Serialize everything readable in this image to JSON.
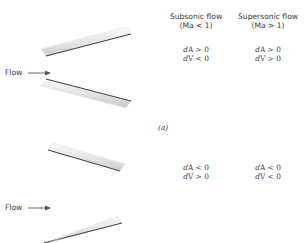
{
  "figure": {
    "type": "technical-diagram",
    "panels": [
      {
        "id": "a",
        "panel_label": "(a)",
        "geometry": "diverging-duct",
        "flow_label": "Flow",
        "flow_arrow": "right-arrow",
        "columns": [
          {
            "heading_line1": "Subsonic flow",
            "heading_line2": "(Ma < 1)",
            "relations": [
              "dA > 0",
              "dV < 0"
            ]
          },
          {
            "heading_line1": "Supersonic flow",
            "heading_line2": "(Ma > 1)",
            "relations": [
              "dA > 0",
              "dV > 0"
            ]
          }
        ]
      },
      {
        "id": "b",
        "panel_label": "",
        "geometry": "converging-duct",
        "flow_label": "Flow",
        "flow_arrow": "right-arrow",
        "columns": [
          {
            "heading_line1": "",
            "heading_line2": "",
            "relations": [
              "dA < 0",
              "dV > 0"
            ]
          },
          {
            "heading_line1": "",
            "heading_line2": "",
            "relations": [
              "dA < 0",
              "dV < 0"
            ]
          }
        ]
      }
    ]
  },
  "colors": {
    "wall_fill_light": "#f2f2f2",
    "wall_fill_mid": "#d9d9d9",
    "wall_edge_dark": "#4a4a4a",
    "text": "#3d3d3d",
    "background": "#ffffff"
  }
}
